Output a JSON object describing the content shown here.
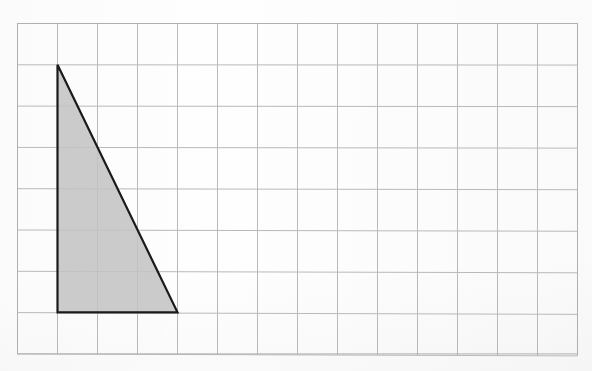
{
  "figure": {
    "title": "",
    "background_color": "#fefefe",
    "grid": {
      "origin_x": 17.5,
      "origin_y": 23.5,
      "cell_width": 40.0,
      "cell_height": 41.3,
      "columns": 14,
      "rows": 8,
      "line_color": "#b9b9b9",
      "border_color": "#b0b0b0",
      "line_width": 1.0
    },
    "shape": {
      "name": "right-triangle",
      "fill_color": "#cbcbcb",
      "stroke_color": "#1a1a1a",
      "stroke_width": 2.2,
      "vertices_grid": [
        {
          "col": 1,
          "row": 1
        },
        {
          "col": 1,
          "row": 7
        },
        {
          "col": 4,
          "row": 7
        }
      ],
      "vertices_px": [
        {
          "x": 57.5,
          "y": 64.8
        },
        {
          "x": 57.5,
          "y": 312.3
        },
        {
          "x": 177.5,
          "y": 312.3
        }
      ],
      "base_cells": 3,
      "height_cells": 6
    }
  },
  "chart_data": {
    "type": "scatter",
    "title": "",
    "xlabel": "",
    "ylabel": "",
    "grid": true,
    "legend": null,
    "xlim": [
      0,
      14
    ],
    "ylim": [
      0,
      8
    ],
    "categories": [],
    "values": [],
    "annotations": [],
    "shapes": [
      {
        "kind": "polygon",
        "label": "shaded right triangle",
        "points": [
          [
            1,
            7
          ],
          [
            1,
            1
          ],
          [
            4,
            1
          ]
        ],
        "fill": "#cbcbcb",
        "stroke": "#1a1a1a",
        "base": 3,
        "height": 6,
        "area": 9
      }
    ]
  }
}
